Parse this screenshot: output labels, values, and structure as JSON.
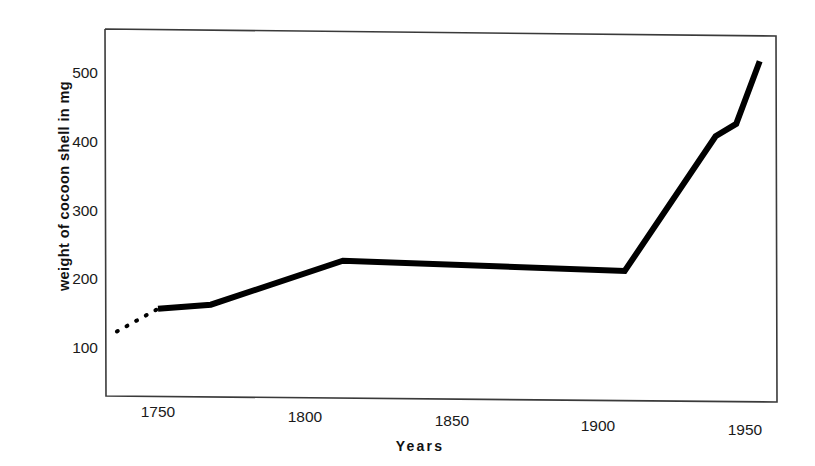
{
  "chart_data": {
    "type": "line",
    "title": "",
    "subtitle": "",
    "xlabel": "Years",
    "ylabel": "weight of cocoon shell in mg",
    "xlim": [
      1733,
      1960
    ],
    "ylim": [
      55,
      560
    ],
    "xticks": [
      1750,
      1800,
      1850,
      1900,
      1950
    ],
    "xticklabels": [
      "1750",
      "1800",
      "1850",
      "1900",
      "1950"
    ],
    "yticks": [
      100,
      200,
      300,
      400,
      500
    ],
    "yticklabels": [
      "100",
      "200",
      "300",
      "400",
      "500"
    ],
    "grid": false,
    "legend": null,
    "legend_position": "none",
    "frame": "box",
    "series": [
      {
        "name": "weight of cocoon shell",
        "style": "dotted",
        "color": "#000000",
        "linewidth": 4,
        "comment": "extrapolated / estimated early segment",
        "x": [
          1736,
          1750
        ],
        "y": [
          124,
          157
        ]
      },
      {
        "name": "weight of cocoon shell",
        "style": "solid",
        "color": "#000000",
        "linewidth": 6,
        "x": [
          1750,
          1768,
          1813,
          1909,
          1940,
          1947,
          1955
        ],
        "y": [
          157,
          163,
          227,
          212,
          408,
          426,
          517
        ]
      }
    ],
    "annotations": []
  },
  "axis": {
    "y_title": "weight of cocoon shell in mg",
    "x_title": "Years"
  }
}
